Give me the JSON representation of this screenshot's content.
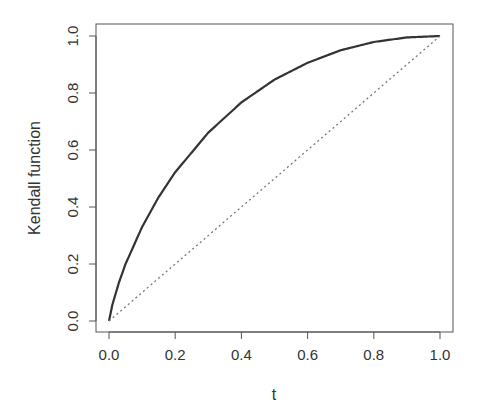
{
  "chart_data": {
    "type": "line",
    "title": "",
    "xlabel": "t",
    "ylabel": "Kendall function",
    "xlim": [
      0,
      1
    ],
    "ylim": [
      0,
      1
    ],
    "grid": false,
    "legend": null,
    "x_ticks": [
      "0.0",
      "0.2",
      "0.4",
      "0.6",
      "0.8",
      "1.0"
    ],
    "y_ticks": [
      "0.0",
      "0.2",
      "0.4",
      "0.6",
      "0.8",
      "1.0"
    ],
    "series": [
      {
        "name": "Kendall function",
        "style": "solid",
        "color": "#333333",
        "x": [
          0.0,
          0.01,
          0.03,
          0.05,
          0.1,
          0.15,
          0.2,
          0.3,
          0.4,
          0.5,
          0.6,
          0.7,
          0.8,
          0.9,
          1.0
        ],
        "values": [
          0.0,
          0.056,
          0.135,
          0.2,
          0.33,
          0.435,
          0.522,
          0.661,
          0.767,
          0.847,
          0.906,
          0.95,
          0.979,
          0.995,
          1.0
        ]
      },
      {
        "name": "diagonal",
        "style": "dotted",
        "color": "#777777",
        "x": [
          0,
          1
        ],
        "values": [
          0,
          1
        ]
      }
    ]
  }
}
